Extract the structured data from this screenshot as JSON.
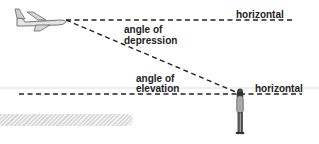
{
  "diagram": {
    "title": "",
    "labels": {
      "horizontal_top": "horizontal",
      "angle_of_depression_line1": "angle of",
      "angle_of_depression_line2": "depression",
      "angle_of_elevation_line1": "angle of",
      "angle_of_elevation_line2": "elevation",
      "horizontal_bottom": "horizontal"
    },
    "icons": {
      "airplane": "airplane-icon",
      "person": "person-icon"
    },
    "colors": {
      "line": "#222222",
      "text": "#222222",
      "ground_line": "#dddddd",
      "hatch": "#d8d8d8"
    }
  }
}
